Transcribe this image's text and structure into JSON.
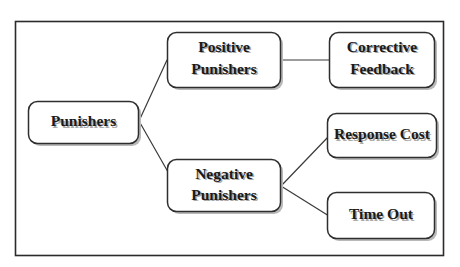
{
  "diagram": {
    "type": "tree",
    "background_color": "#ffffff",
    "frame_color": "#2b2b2b",
    "box_fill": "#ffffff",
    "box_border_color": "#2e2e2e",
    "text_color": "#1a1a1a",
    "connector_color": "#3a3a3a",
    "nodes": {
      "root": {
        "line1": "Punishers",
        "line2": ""
      },
      "positive": {
        "line1": "Positive",
        "line2": "Punishers"
      },
      "negative": {
        "line1": "Negative",
        "line2": "Punishers"
      },
      "corrective": {
        "line1": "Corrective",
        "line2": "Feedback"
      },
      "response_cost": {
        "line1": "Response Cost",
        "line2": ""
      },
      "time_out": {
        "line1": "Time Out",
        "line2": ""
      }
    },
    "edges": [
      {
        "from": "Punishers",
        "to": "Positive Punishers"
      },
      {
        "from": "Punishers",
        "to": "Negative Punishers"
      },
      {
        "from": "Positive Punishers",
        "to": "Corrective Feedback"
      },
      {
        "from": "Negative Punishers",
        "to": "Response Cost"
      },
      {
        "from": "Negative Punishers",
        "to": "Time Out"
      }
    ]
  }
}
